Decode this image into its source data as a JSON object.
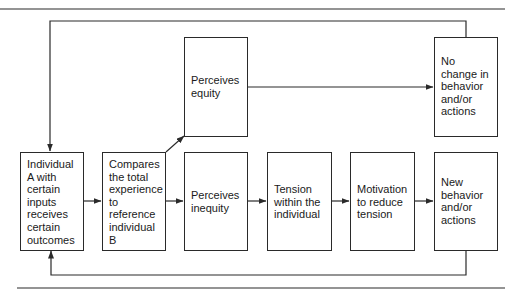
{
  "diagram": {
    "type": "flowchart",
    "title": "",
    "nodes": [
      {
        "id": "individual_a",
        "label": "Individual\nA with\ncertain\ninputs\nreceives\ncertain\noutcomes"
      },
      {
        "id": "compares",
        "label": "Compares\nthe total\nexperience\nto\nreference\nindividual\nB"
      },
      {
        "id": "perceives_equity",
        "label": "Perceives\nequity"
      },
      {
        "id": "no_change",
        "label": "No\nchange in\nbehavior\nand/or\nactions"
      },
      {
        "id": "perceives_inequity",
        "label": "Perceives\ninequity"
      },
      {
        "id": "tension",
        "label": "Tension\nwithin the\nindividual"
      },
      {
        "id": "motivation",
        "label": "Motivation\nto reduce\ntension"
      },
      {
        "id": "new_behavior",
        "label": "New\nbehavior\nand/or\nactions"
      }
    ],
    "edges": [
      {
        "from": "individual_a",
        "to": "compares"
      },
      {
        "from": "compares",
        "to": "perceives_equity"
      },
      {
        "from": "compares",
        "to": "perceives_inequity"
      },
      {
        "from": "perceives_equity",
        "to": "no_change"
      },
      {
        "from": "perceives_inequity",
        "to": "tension"
      },
      {
        "from": "tension",
        "to": "motivation"
      },
      {
        "from": "motivation",
        "to": "new_behavior"
      },
      {
        "from": "no_change",
        "to": "individual_a",
        "route": "top feedback loop"
      },
      {
        "from": "new_behavior",
        "to": "individual_a",
        "route": "bottom feedback loop"
      }
    ]
  },
  "colors": {
    "line": "#2a2a2a",
    "background": "#ffffff"
  }
}
